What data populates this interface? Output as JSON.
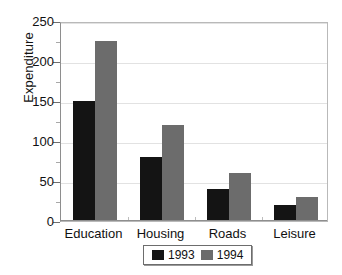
{
  "chart_data": {
    "type": "bar",
    "title": "",
    "xlabel": "",
    "ylabel": "Expenditure",
    "categories": [
      "Education",
      "Housing",
      "Roads",
      "Leisure"
    ],
    "series": [
      {
        "name": "1993",
        "color": "#141414",
        "values": [
          150,
          80,
          40,
          20
        ]
      },
      {
        "name": "1994",
        "color": "#6c6c6c",
        "values": [
          225,
          120,
          60,
          30
        ]
      }
    ],
    "ylim": [
      0,
      250
    ],
    "yticks": [
      0,
      50,
      100,
      150,
      200,
      250
    ],
    "ytick_labels": [
      "0",
      "50",
      "100",
      "150",
      "200",
      "250"
    ],
    "yminor_ticks": [
      25,
      75,
      125,
      175,
      225
    ],
    "grid": true,
    "legend_position": "bottom"
  },
  "axes": {
    "y_title": "Expenditure"
  },
  "legend": {
    "entries": [
      {
        "label": "1993"
      },
      {
        "label": "1994"
      }
    ]
  }
}
